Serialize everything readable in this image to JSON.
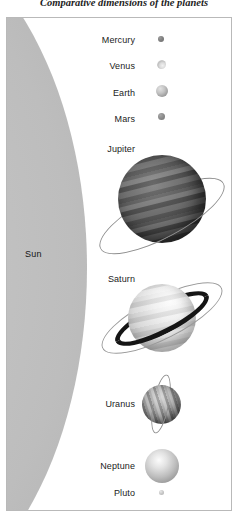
{
  "caption": "Comparative dimensions of the planets",
  "plate": {
    "sun": {
      "label": "Sun"
    },
    "rows": [
      {
        "name": "mercury",
        "label": "Mercury"
      },
      {
        "name": "venus",
        "label": "Venus"
      },
      {
        "name": "earth",
        "label": "Earth"
      },
      {
        "name": "mars",
        "label": "Mars"
      },
      {
        "name": "jupiter",
        "label": "Jupiter"
      },
      {
        "name": "saturn",
        "label": "Saturn"
      },
      {
        "name": "uranus",
        "label": "Uranus"
      },
      {
        "name": "neptune",
        "label": "Neptune"
      },
      {
        "name": "pluto",
        "label": "Pluto"
      }
    ]
  },
  "colors": {
    "sun_light": "#c9c9c9",
    "sun_dark": "#9a9a9a",
    "frame": "#b9b9b9",
    "ring_line": "#8d8d8d",
    "saturn_ring": "#151515",
    "text": "#1b1b1b",
    "background": "#ffffff"
  }
}
